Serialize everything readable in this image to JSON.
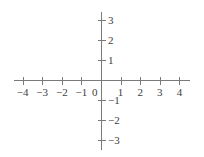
{
  "chart_data": {
    "type": "scatter",
    "title": "",
    "subtitle": "",
    "xlabel": "",
    "ylabel": "",
    "grid": false,
    "legend": false,
    "legend_position": "none",
    "xlim": [
      -4.5,
      4.5
    ],
    "ylim": [
      -3.6,
      3.6
    ],
    "x_ticks": [
      -4,
      -3,
      -2,
      -1,
      1,
      2,
      3,
      4
    ],
    "y_ticks": [
      3,
      2,
      1,
      -1,
      -2,
      -3
    ],
    "x_tick_labels": [
      "−4",
      "−3",
      "−2",
      "−1",
      "1",
      "2",
      "3",
      "4"
    ],
    "y_tick_labels": [
      "3",
      "2",
      "1",
      "−1",
      "−2",
      "−3"
    ],
    "origin_label": "0",
    "series": [
      {
        "name": "",
        "x": [],
        "y": []
      }
    ],
    "annotations": [],
    "axis_color": "#7a7a7a",
    "tick_color": "#7a7a7a",
    "label_color": "#3d3d3d",
    "background_color": "#ffffff"
  },
  "geometry": {
    "origin_x": 101,
    "origin_y": 80,
    "unit_x": 19.6,
    "unit_y": 20,
    "x_axis_start": 14,
    "x_axis_end": 190,
    "y_axis_start": 12,
    "y_axis_end": 150,
    "tick_half_length": 3.5
  }
}
